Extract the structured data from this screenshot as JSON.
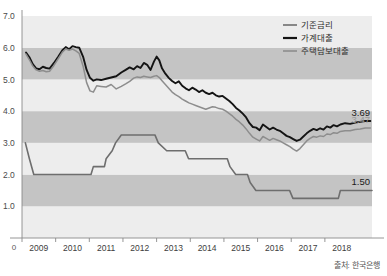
{
  "chart_data": {
    "type": "line",
    "title": "",
    "xlabel": "",
    "ylabel": "",
    "ylim": [
      0,
      7.0
    ],
    "xlim": [
      2008.5,
      2018.9
    ],
    "grid": false,
    "bands": "alternating horizontal gray bands every 1.0 unit",
    "legend_position": "top-right",
    "y_ticks": [
      "0",
      "1.0",
      "2.0",
      "3.0",
      "4.0",
      "5.0",
      "6.0",
      "7.0"
    ],
    "y_tick_values": [
      0,
      1.0,
      2.0,
      3.0,
      4.0,
      5.0,
      6.0,
      7.0
    ],
    "x_ticks": [
      "2009",
      "2010",
      "2011",
      "2012",
      "2013",
      "2014",
      "2015",
      "2016",
      "2017",
      "2018"
    ],
    "x_tick_values": [
      2009,
      2010,
      2011,
      2012,
      2013,
      2014,
      2015,
      2016,
      2017,
      2018
    ],
    "origin_label": "0",
    "source": "출처: 한국은행",
    "series": [
      {
        "name": "기준금리",
        "color": "#6e6e6e",
        "width": 1.6,
        "points": [
          [
            2008.6,
            3.0
          ],
          [
            2008.72,
            2.5
          ],
          [
            2008.85,
            2.0
          ],
          [
            2009.0,
            2.0
          ],
          [
            2009.3,
            2.0
          ],
          [
            2009.6,
            2.0
          ],
          [
            2009.9,
            2.0
          ],
          [
            2010.2,
            2.0
          ],
          [
            2010.55,
            2.0
          ],
          [
            2010.62,
            2.25
          ],
          [
            2010.95,
            2.25
          ],
          [
            2011.0,
            2.5
          ],
          [
            2011.18,
            2.75
          ],
          [
            2011.28,
            3.0
          ],
          [
            2011.45,
            3.25
          ],
          [
            2011.95,
            3.25
          ],
          [
            2012.45,
            3.25
          ],
          [
            2012.55,
            3.0
          ],
          [
            2012.8,
            2.75
          ],
          [
            2013.35,
            2.75
          ],
          [
            2013.45,
            2.5
          ],
          [
            2014.6,
            2.5
          ],
          [
            2014.68,
            2.25
          ],
          [
            2014.85,
            2.0
          ],
          [
            2015.2,
            2.0
          ],
          [
            2015.28,
            1.75
          ],
          [
            2015.45,
            1.5
          ],
          [
            2016.45,
            1.5
          ],
          [
            2016.55,
            1.25
          ],
          [
            2017.9,
            1.25
          ],
          [
            2017.96,
            1.5
          ],
          [
            2018.9,
            1.5
          ]
        ]
      },
      {
        "name": "가계대출",
        "color": "#141414",
        "width": 1.9,
        "points": [
          [
            2008.62,
            5.85
          ],
          [
            2008.72,
            5.7
          ],
          [
            2008.82,
            5.48
          ],
          [
            2008.92,
            5.35
          ],
          [
            2009.02,
            5.32
          ],
          [
            2009.12,
            5.4
          ],
          [
            2009.22,
            5.36
          ],
          [
            2009.32,
            5.34
          ],
          [
            2009.45,
            5.52
          ],
          [
            2009.58,
            5.72
          ],
          [
            2009.7,
            5.92
          ],
          [
            2009.8,
            6.02
          ],
          [
            2009.9,
            5.95
          ],
          [
            2010.0,
            6.05
          ],
          [
            2010.1,
            6.02
          ],
          [
            2010.2,
            6.0
          ],
          [
            2010.32,
            5.7
          ],
          [
            2010.42,
            5.3
          ],
          [
            2010.52,
            5.05
          ],
          [
            2010.62,
            4.96
          ],
          [
            2010.72,
            5.0
          ],
          [
            2010.85,
            4.98
          ],
          [
            2011.0,
            5.02
          ],
          [
            2011.15,
            5.06
          ],
          [
            2011.3,
            5.1
          ],
          [
            2011.45,
            5.22
          ],
          [
            2011.58,
            5.3
          ],
          [
            2011.7,
            5.38
          ],
          [
            2011.82,
            5.32
          ],
          [
            2011.92,
            5.42
          ],
          [
            2012.02,
            5.36
          ],
          [
            2012.12,
            5.52
          ],
          [
            2012.22,
            5.46
          ],
          [
            2012.32,
            5.3
          ],
          [
            2012.42,
            5.56
          ],
          [
            2012.5,
            5.72
          ],
          [
            2012.58,
            5.6
          ],
          [
            2012.66,
            5.35
          ],
          [
            2012.76,
            5.18
          ],
          [
            2012.86,
            5.05
          ],
          [
            2012.96,
            4.95
          ],
          [
            2013.06,
            4.88
          ],
          [
            2013.16,
            4.94
          ],
          [
            2013.26,
            4.8
          ],
          [
            2013.36,
            4.72
          ],
          [
            2013.46,
            4.66
          ],
          [
            2013.56,
            4.74
          ],
          [
            2013.66,
            4.68
          ],
          [
            2013.76,
            4.6
          ],
          [
            2013.86,
            4.66
          ],
          [
            2013.96,
            4.58
          ],
          [
            2014.06,
            4.54
          ],
          [
            2014.16,
            4.58
          ],
          [
            2014.26,
            4.5
          ],
          [
            2014.36,
            4.46
          ],
          [
            2014.46,
            4.48
          ],
          [
            2014.56,
            4.4
          ],
          [
            2014.66,
            4.32
          ],
          [
            2014.76,
            4.22
          ],
          [
            2014.86,
            4.1
          ],
          [
            2014.96,
            4.02
          ],
          [
            2015.06,
            3.92
          ],
          [
            2015.16,
            3.8
          ],
          [
            2015.26,
            3.62
          ],
          [
            2015.36,
            3.5
          ],
          [
            2015.46,
            3.48
          ],
          [
            2015.56,
            3.4
          ],
          [
            2015.66,
            3.58
          ],
          [
            2015.76,
            3.5
          ],
          [
            2015.86,
            3.42
          ],
          [
            2015.96,
            3.48
          ],
          [
            2016.06,
            3.42
          ],
          [
            2016.16,
            3.38
          ],
          [
            2016.26,
            3.3
          ],
          [
            2016.36,
            3.22
          ],
          [
            2016.46,
            3.18
          ],
          [
            2016.56,
            3.12
          ],
          [
            2016.66,
            3.06
          ],
          [
            2016.76,
            3.1
          ],
          [
            2016.86,
            3.2
          ],
          [
            2016.96,
            3.3
          ],
          [
            2017.06,
            3.38
          ],
          [
            2017.16,
            3.44
          ],
          [
            2017.26,
            3.4
          ],
          [
            2017.36,
            3.46
          ],
          [
            2017.46,
            3.42
          ],
          [
            2017.56,
            3.52
          ],
          [
            2017.66,
            3.48
          ],
          [
            2017.76,
            3.56
          ],
          [
            2017.86,
            3.52
          ],
          [
            2017.96,
            3.58
          ],
          [
            2018.1,
            3.62
          ],
          [
            2018.25,
            3.6
          ],
          [
            2018.4,
            3.64
          ],
          [
            2018.55,
            3.66
          ],
          [
            2018.7,
            3.69
          ],
          [
            2018.85,
            3.69
          ]
        ]
      },
      {
        "name": "주택담보대출",
        "color": "#8d8d8d",
        "width": 1.5,
        "points": [
          [
            2008.62,
            5.8
          ],
          [
            2008.72,
            5.62
          ],
          [
            2008.82,
            5.42
          ],
          [
            2008.92,
            5.3
          ],
          [
            2009.02,
            5.26
          ],
          [
            2009.12,
            5.28
          ],
          [
            2009.22,
            5.24
          ],
          [
            2009.32,
            5.26
          ],
          [
            2009.45,
            5.44
          ],
          [
            2009.58,
            5.66
          ],
          [
            2009.7,
            5.86
          ],
          [
            2009.8,
            5.96
          ],
          [
            2009.9,
            5.92
          ],
          [
            2010.0,
            5.96
          ],
          [
            2010.1,
            5.9
          ],
          [
            2010.2,
            5.82
          ],
          [
            2010.32,
            5.4
          ],
          [
            2010.42,
            4.9
          ],
          [
            2010.52,
            4.64
          ],
          [
            2010.62,
            4.6
          ],
          [
            2010.72,
            4.8
          ],
          [
            2010.85,
            4.78
          ],
          [
            2011.0,
            4.76
          ],
          [
            2011.15,
            4.84
          ],
          [
            2011.3,
            4.7
          ],
          [
            2011.45,
            4.78
          ],
          [
            2011.58,
            4.86
          ],
          [
            2011.7,
            4.94
          ],
          [
            2011.82,
            5.04
          ],
          [
            2011.92,
            5.08
          ],
          [
            2012.02,
            5.06
          ],
          [
            2012.12,
            5.1
          ],
          [
            2012.22,
            5.08
          ],
          [
            2012.32,
            5.06
          ],
          [
            2012.42,
            5.1
          ],
          [
            2012.5,
            5.12
          ],
          [
            2012.58,
            5.06
          ],
          [
            2012.66,
            4.96
          ],
          [
            2012.76,
            4.84
          ],
          [
            2012.86,
            4.72
          ],
          [
            2012.96,
            4.6
          ],
          [
            2013.06,
            4.52
          ],
          [
            2013.16,
            4.46
          ],
          [
            2013.26,
            4.38
          ],
          [
            2013.36,
            4.32
          ],
          [
            2013.46,
            4.26
          ],
          [
            2013.56,
            4.22
          ],
          [
            2013.66,
            4.18
          ],
          [
            2013.76,
            4.14
          ],
          [
            2013.86,
            4.1
          ],
          [
            2013.96,
            4.06
          ],
          [
            2014.06,
            4.1
          ],
          [
            2014.16,
            4.14
          ],
          [
            2014.26,
            4.12
          ],
          [
            2014.36,
            4.08
          ],
          [
            2014.46,
            4.06
          ],
          [
            2014.56,
            4.0
          ],
          [
            2014.66,
            3.92
          ],
          [
            2014.76,
            3.84
          ],
          [
            2014.86,
            3.74
          ],
          [
            2014.96,
            3.66
          ],
          [
            2015.06,
            3.56
          ],
          [
            2015.16,
            3.44
          ],
          [
            2015.26,
            3.3
          ],
          [
            2015.36,
            3.18
          ],
          [
            2015.46,
            3.12
          ],
          [
            2015.56,
            3.06
          ],
          [
            2015.66,
            3.2
          ],
          [
            2015.76,
            3.14
          ],
          [
            2015.86,
            3.08
          ],
          [
            2015.96,
            3.14
          ],
          [
            2016.06,
            3.1
          ],
          [
            2016.16,
            3.06
          ],
          [
            2016.26,
            3.0
          ],
          [
            2016.36,
            2.94
          ],
          [
            2016.46,
            2.88
          ],
          [
            2016.56,
            2.8
          ],
          [
            2016.66,
            2.74
          ],
          [
            2016.76,
            2.82
          ],
          [
            2016.86,
            2.94
          ],
          [
            2016.96,
            3.06
          ],
          [
            2017.06,
            3.14
          ],
          [
            2017.16,
            3.2
          ],
          [
            2017.26,
            3.18
          ],
          [
            2017.36,
            3.22
          ],
          [
            2017.46,
            3.2
          ],
          [
            2017.56,
            3.28
          ],
          [
            2017.66,
            3.26
          ],
          [
            2017.76,
            3.32
          ],
          [
            2017.86,
            3.3
          ],
          [
            2017.96,
            3.36
          ],
          [
            2018.1,
            3.38
          ],
          [
            2018.25,
            3.38
          ],
          [
            2018.4,
            3.42
          ],
          [
            2018.55,
            3.44
          ],
          [
            2018.7,
            3.47
          ],
          [
            2018.85,
            3.47
          ]
        ]
      }
    ],
    "annotations": [
      {
        "label": "3.69",
        "value": 3.69,
        "style": "dark"
      },
      {
        "label": "3.47",
        "value": 3.47,
        "style": "gray"
      },
      {
        "label": "1.50",
        "value": 1.5,
        "style": "dark"
      }
    ]
  },
  "legend": {
    "items": [
      {
        "label": "기준금리",
        "color": "#6e6e6e"
      },
      {
        "label": "가계대출",
        "color": "#141414"
      },
      {
        "label": "주택담보대출",
        "color": "#8d8d8d"
      }
    ]
  },
  "colors": {
    "band_light": "#ededed",
    "band_dark": "#c4c4c4",
    "axis": "#8a8a8a",
    "background": "#ffffff"
  },
  "source_note": "출처: 한국은행"
}
